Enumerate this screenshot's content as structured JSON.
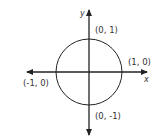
{
  "diagram": {
    "colors": {
      "stroke": "#222222",
      "text": "#333333",
      "background": "#ffffff"
    },
    "axes": {
      "x_label": "x",
      "y_label": "y"
    },
    "points": [
      {
        "id": "top",
        "label": "(0, 1)"
      },
      {
        "id": "right",
        "label": "(1, 0)"
      },
      {
        "id": "left",
        "label": "(-1, 0)"
      },
      {
        "id": "bottom",
        "label": "(0, -1)"
      }
    ]
  }
}
